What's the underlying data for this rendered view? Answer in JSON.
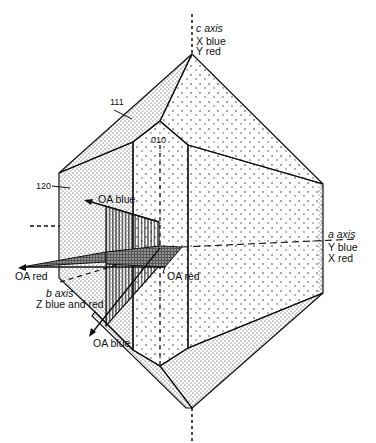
{
  "figure": {
    "type": "crystal-optical-orientation-diagram",
    "axes": {
      "c": {
        "name": "c axis",
        "line1": "X blue",
        "line2": "Y red"
      },
      "a": {
        "name": "a axis",
        "line1": "Y blue",
        "line2": "X red"
      },
      "b": {
        "name": "b axis",
        "line1": "Z blue and red"
      }
    },
    "faces": {
      "f111": "111",
      "f010": "010",
      "f120": "120"
    },
    "optic_axes": {
      "oa_blue_upper": "OA blue",
      "oa_blue_lower": "OA blue",
      "oa_red_left": "OA red",
      "oa_red_right": "OA red"
    },
    "colors": {
      "ink": "#111111",
      "background": "#ffffff"
    }
  }
}
